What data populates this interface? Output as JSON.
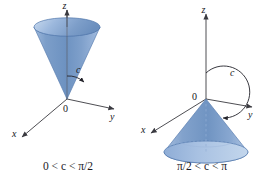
{
  "figure": {
    "background_color": "#ffffff"
  },
  "colors": {
    "cone_fill_light": "#b9cce6",
    "cone_fill_mid": "#7f9fcb",
    "cone_fill_dark": "#5f82b5",
    "cone_top_ellipse_light": "#c9daee",
    "cone_top_ellipse_dark": "#7e9fca",
    "cone_outline": "#4a6d9f",
    "axis_color": "#3a3a40",
    "text_color": "#16161a",
    "accent_blue": "#5f82b5"
  },
  "panels": [
    {
      "id": "left-panel",
      "name": "cone-upward",
      "caption": "0 < c < π/2",
      "axes": [
        {
          "name": "z-axis",
          "label": "z"
        },
        {
          "name": "y-axis",
          "label": "y"
        },
        {
          "name": "x-axis",
          "label": "x"
        }
      ],
      "origin_label": "0",
      "angle_label": "c",
      "angle_description": "angle from positive z-axis to cone surface, acute"
    },
    {
      "id": "right-panel",
      "name": "cone-downward",
      "caption": "π/2 < c < π",
      "axes": [
        {
          "name": "z-axis",
          "label": "z"
        },
        {
          "name": "y-axis",
          "label": "y"
        },
        {
          "name": "x-axis",
          "label": "x"
        }
      ],
      "origin_label": "0",
      "angle_label": "c",
      "angle_description": "angle from positive z-axis to cone surface, obtuse"
    }
  ]
}
